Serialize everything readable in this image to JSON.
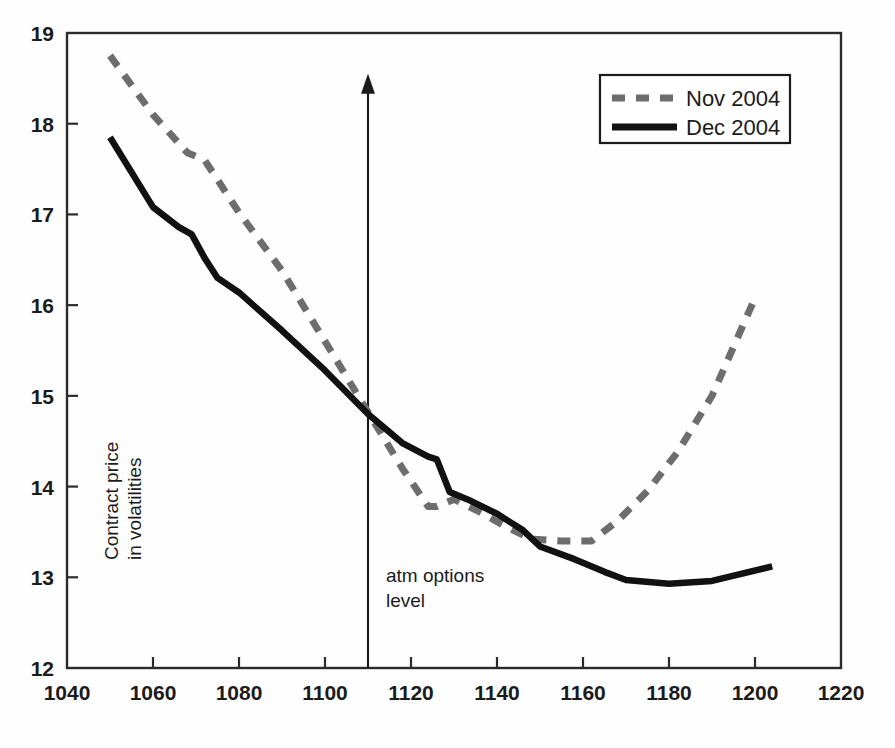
{
  "chart_data": {
    "type": "line",
    "title": "",
    "subtitle": "",
    "xlabel": "",
    "ylabel": "Contract price in volatilities",
    "ylabel_lines": [
      "Contract price",
      "in volatilities"
    ],
    "xlim": [
      1040,
      1220
    ],
    "ylim": [
      12,
      19
    ],
    "xticks": [
      1040,
      1060,
      1080,
      1100,
      1120,
      1140,
      1160,
      1180,
      1200,
      1220
    ],
    "yticks": [
      12,
      13,
      14,
      15,
      16,
      17,
      18,
      19
    ],
    "grid": false,
    "legend_position": "top-right",
    "series": [
      {
        "name": "Nov 2004",
        "style": "dashed",
        "color": "#6d6d6d",
        "x": [
          1050,
          1060,
          1068,
          1072,
          1080,
          1090,
          1100,
          1110,
          1118,
          1124,
          1126,
          1130,
          1136,
          1142,
          1148,
          1155,
          1162,
          1168,
          1175,
          1182,
          1190,
          1200
        ],
        "y": [
          18.75,
          18.1,
          17.68,
          17.6,
          17.02,
          16.38,
          15.6,
          14.82,
          14.2,
          13.78,
          13.78,
          13.86,
          13.72,
          13.56,
          13.42,
          13.4,
          13.4,
          13.62,
          13.95,
          14.38,
          15.0,
          16.08
        ]
      },
      {
        "name": "Dec 2004",
        "style": "solid",
        "color": "#111111",
        "x": [
          1050,
          1060,
          1066,
          1069,
          1072,
          1075,
          1080,
          1090,
          1100,
          1110,
          1118,
          1124,
          1126,
          1129,
          1134,
          1140,
          1146,
          1150,
          1158,
          1165,
          1170,
          1180,
          1190,
          1204
        ],
        "y": [
          17.85,
          17.08,
          16.86,
          16.78,
          16.52,
          16.3,
          16.14,
          15.72,
          15.28,
          14.8,
          14.48,
          14.33,
          14.3,
          13.94,
          13.84,
          13.7,
          13.52,
          13.34,
          13.2,
          13.06,
          12.97,
          12.93,
          12.96,
          13.12
        ]
      }
    ],
    "annotations": [
      {
        "name": "atm-options-level",
        "text": "atm options level",
        "text_lines": [
          "atm options",
          "level"
        ],
        "x": 1110,
        "y_from": 12.0,
        "y_to": 18.55,
        "marker": "vertical-arrow-up"
      }
    ]
  },
  "legend": {
    "entries": [
      {
        "label": "Nov 2004",
        "style": "dashed",
        "color": "#6d6d6d"
      },
      {
        "label": "Dec 2004",
        "style": "solid",
        "color": "#111111"
      }
    ]
  },
  "axis": {
    "x_tick_labels": [
      "1040",
      "1060",
      "1080",
      "1100",
      "1120",
      "1140",
      "1160",
      "1180",
      "1200",
      "1220"
    ],
    "y_tick_labels": [
      "12",
      "13",
      "14",
      "15",
      "16",
      "17",
      "18",
      "19"
    ]
  },
  "colors": {
    "background": "#fefefe",
    "frame": "#2b2b2b",
    "series_dashed": "#6d6d6d",
    "series_solid": "#111111",
    "text": "#1b1b1b"
  }
}
